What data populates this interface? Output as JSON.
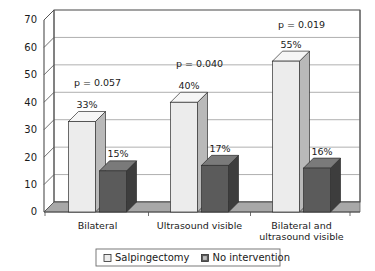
{
  "chart_data": {
    "type": "bar",
    "title": "",
    "subtitle": "",
    "xlabel": "",
    "ylabel": "",
    "ylim": [
      0,
      70
    ],
    "ytick_step": 10,
    "yticks": [
      "0",
      "10",
      "20",
      "30",
      "40",
      "50",
      "60",
      "70"
    ],
    "grid": true,
    "three_d": true,
    "legend_position": "bottom",
    "categories": [
      "Bilateral",
      "Ultrasound visible",
      "Bilateral and\nultrasound visible"
    ],
    "category_lines": [
      [
        "Bilateral"
      ],
      [
        "Ultrasound visible"
      ],
      [
        "Bilateral and",
        "ultrasound visible"
      ]
    ],
    "series": [
      {
        "name": "Salpingectomy",
        "values": [
          33,
          40,
          55
        ],
        "value_labels": [
          "33%",
          "40%",
          "55%"
        ],
        "color": "#ececec",
        "side_color": "#b9b9b9",
        "top_color": "#f6f6f6"
      },
      {
        "name": "No intervention",
        "values": [
          15,
          17,
          16
        ],
        "value_labels": [
          "15%",
          "17%",
          "16%"
        ],
        "color": "#5b5b5b",
        "side_color": "#3d3d3d",
        "top_color": "#7a7a7a"
      }
    ],
    "annotations": [
      {
        "text": "p = 0.057",
        "group": 0,
        "y": 46
      },
      {
        "text": "p = 0.040",
        "group": 1,
        "y": 53
      },
      {
        "text": "p = 0.019",
        "group": 2,
        "y": 67
      }
    ],
    "axis_color": "#4d4d4d",
    "grid_color": "#8c8c8c",
    "floor_color": "#9a9a9a",
    "background": "#ffffff"
  },
  "legend": {
    "items": [
      {
        "label": "Salpingectomy",
        "swatch": "#ececec"
      },
      {
        "label": "No intervention",
        "swatch": "#5b5b5b"
      }
    ]
  }
}
